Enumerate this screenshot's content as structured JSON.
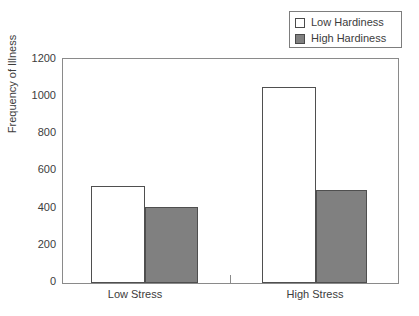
{
  "chart_data": {
    "type": "bar",
    "title": "",
    "subtitle": "",
    "xlabel": "",
    "ylabel": "Frequency of Illness",
    "categories": [
      "Low Stress",
      "High Stress"
    ],
    "series": [
      {
        "name": "Low Hardiness",
        "values": [
          520,
          1050
        ],
        "color": "#ffffff",
        "edge_color": "#4f4f4f"
      },
      {
        "name": "High Hardiness",
        "values": [
          405,
          500
        ],
        "color": "#808080",
        "edge_color": "#4f4f4f"
      }
    ],
    "ylim": [
      0,
      1200
    ],
    "y_ticks": [
      1200,
      1000,
      800,
      600,
      400,
      200,
      0
    ],
    "y_tick_labels": [
      "1200",
      "1000",
      "800",
      "600",
      "400",
      "200",
      "0"
    ],
    "grid": false,
    "legend_position": "top-right",
    "frame": "box"
  },
  "legend": {
    "entries": [
      {
        "label": "Low Hardiness",
        "swatch": "#ffffff"
      },
      {
        "label": "High Hardiness",
        "swatch": "#808080"
      }
    ]
  },
  "axes": {
    "y_title": "Frequency of Illness",
    "y_labels": {
      "t0": "1200",
      "t1": "1000",
      "t2": "800",
      "t3": "600",
      "t4": "400",
      "t5": "200",
      "t6": "0"
    },
    "x_labels": {
      "g0": "Low Stress",
      "g1": "High Stress"
    }
  },
  "colors": {
    "bar_open": "#ffffff",
    "bar_filled": "#808080",
    "bar_edge": "#4f4f4f",
    "axis": "#8a8a8a",
    "text": "#3c3c3c",
    "background": "#ffffff"
  }
}
